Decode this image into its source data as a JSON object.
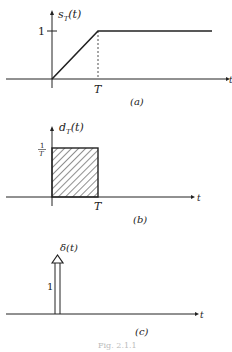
{
  "panels": [
    {
      "id": "a",
      "ylabel": "s",
      "ylabel_sub": "T",
      "ylabel_arg": "(t)",
      "ytick": "1",
      "xtick": "T",
      "xlabel": "t",
      "caption": "(a)"
    },
    {
      "id": "b",
      "ylabel": "d",
      "ylabel_sub": "T",
      "ylabel_arg": "(t)",
      "ytick_num": "1",
      "ytick_den": "T",
      "xtick": "T",
      "xlabel": "t",
      "caption": "(b)"
    },
    {
      "id": "c",
      "ylabel": "δ(t)",
      "weight": "1",
      "xlabel": "t",
      "caption": "(c)"
    }
  ],
  "figure_caption": "Fig. 2.1.1",
  "colors": {
    "ink": "#222222",
    "caption": "#bbbbbb"
  }
}
